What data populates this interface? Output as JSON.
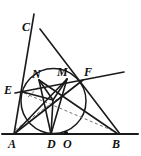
{
  "figure": {
    "kind": "euclidean-geometry-diagram",
    "width": 141,
    "height": 156,
    "background_color": "#ffffff",
    "stroke_color": "#1a1a1a",
    "dashed_color": "#6a6a6a",
    "labels": [
      {
        "id": "C",
        "text": "C",
        "x": 22,
        "y": 21
      },
      {
        "id": "F",
        "text": "F",
        "x": 84,
        "y": 68
      },
      {
        "id": "E",
        "text": "E",
        "x": 5,
        "y": 85
      },
      {
        "id": "N",
        "text": "N",
        "x": 33,
        "y": 70
      },
      {
        "id": "M",
        "text": "M",
        "x": 58,
        "y": 68
      },
      {
        "id": "A",
        "text": "A",
        "x": 8,
        "y": 139
      },
      {
        "id": "D",
        "text": "D",
        "x": 48,
        "y": 139
      },
      {
        "id": "O",
        "text": "O",
        "x": 63,
        "y": 139
      },
      {
        "id": "B",
        "text": "B",
        "x": 113,
        "y": 139
      }
    ],
    "points": [
      {
        "id": "A",
        "x": 14,
        "y": 134
      },
      {
        "id": "B",
        "x": 118,
        "y": 134
      },
      {
        "id": "C",
        "x": 40,
        "y": 29
      },
      {
        "id": "D",
        "x": 51,
        "y": 134
      },
      {
        "id": "O",
        "x": 66,
        "y": 134
      },
      {
        "id": "E",
        "x": 23,
        "y": 92
      },
      {
        "id": "N",
        "x": 39,
        "y": 80
      },
      {
        "id": "M",
        "x": 67,
        "y": 79
      },
      {
        "id": "F",
        "x": 82,
        "y": 81
      },
      {
        "id": "I",
        "x": 53,
        "y": 100
      }
    ],
    "circle": {
      "cx": 53.5,
      "cy": 101,
      "r": 32.5
    },
    "solid_segments": [
      {
        "name": "baseline-AB",
        "from": [
          2,
          134
        ],
        "to": [
          138,
          134
        ]
      },
      {
        "name": "ray-A-to-C",
        "from": [
          14,
          134
        ],
        "to": [
          34,
          14
        ]
      },
      {
        "name": "segment-C-to-B",
        "from": [
          40,
          29
        ],
        "to": [
          120,
          134
        ]
      },
      {
        "name": "ray-E-to-F-extended",
        "from": [
          15,
          93
        ],
        "to": [
          124,
          72
        ]
      },
      {
        "name": "segment-A-to-F",
        "from": [
          14,
          134
        ],
        "to": [
          83,
          80
        ]
      },
      {
        "name": "segment-A-to-M",
        "from": [
          14,
          134
        ],
        "to": [
          67,
          79
        ]
      },
      {
        "name": "segment-D-to-N",
        "from": [
          51,
          134
        ],
        "to": [
          39,
          80
        ]
      },
      {
        "name": "segment-D-to-M",
        "from": [
          51,
          134
        ],
        "to": [
          67,
          79
        ]
      },
      {
        "name": "segment-D-to-I",
        "from": [
          51,
          134
        ],
        "to": [
          53,
          100
        ]
      },
      {
        "name": "segment-N-to-B",
        "from": [
          39,
          80
        ],
        "to": [
          118,
          134
        ]
      },
      {
        "name": "segment-E-to-I",
        "from": [
          23,
          92
        ],
        "to": [
          53,
          100
        ]
      },
      {
        "name": "segment-I-to-M",
        "from": [
          53,
          100
        ],
        "to": [
          67,
          79
        ]
      },
      {
        "name": "segment-I-to-N",
        "from": [
          53,
          100
        ],
        "to": [
          39,
          80
        ]
      }
    ],
    "dashed_segments": [
      {
        "name": "dashed-A-to-F",
        "from": [
          15,
          130
        ],
        "to": [
          82,
          81
        ]
      },
      {
        "name": "dashed-E-to-B",
        "from": [
          24,
          93
        ],
        "to": [
          116,
          132
        ]
      },
      {
        "name": "dashed-N-short-tick",
        "from": [
          28,
          96
        ],
        "to": [
          41,
          85
        ]
      }
    ],
    "dots": [
      {
        "name": "point-O-dot",
        "x": 66,
        "y": 133,
        "r": 2.1
      }
    ]
  }
}
